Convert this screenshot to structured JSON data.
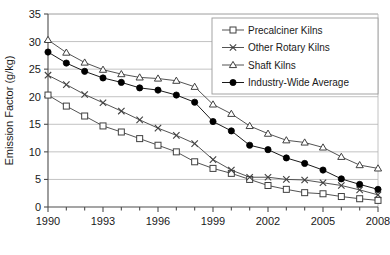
{
  "chart_data": {
    "type": "line",
    "title": "",
    "xlabel": "",
    "ylabel": "Emission Factor (g/kg)",
    "xlim": [
      1990,
      2008
    ],
    "ylim": [
      0,
      35
    ],
    "yticks": [
      0,
      5,
      10,
      15,
      20,
      25,
      30,
      35
    ],
    "ytick_labels": [
      "0",
      "5",
      "10",
      "15",
      "20",
      "25",
      "30",
      "35"
    ],
    "xticks": [
      1990,
      1993,
      1996,
      1999,
      2002,
      2005,
      2008
    ],
    "xtick_labels": [
      "1990",
      "1993",
      "1996",
      "1999",
      "2002",
      "2005",
      "2008"
    ],
    "x": [
      1990,
      1991,
      1992,
      1993,
      1994,
      1995,
      1996,
      1997,
      1998,
      1999,
      2000,
      2001,
      2002,
      2003,
      2004,
      2005,
      2006,
      2007,
      2008
    ],
    "grid": "horizontal",
    "legend_position": "top-right",
    "series": [
      {
        "name": "Precalciner Kilns",
        "marker": "open-square",
        "color": "#404040",
        "values": [
          20.3,
          18.3,
          16.5,
          14.7,
          13.6,
          12.4,
          11.2,
          10.0,
          8.2,
          7.0,
          6.1,
          5.0,
          3.9,
          3.2,
          2.6,
          2.4,
          1.9,
          1.5,
          1.2
        ]
      },
      {
        "name": "Other Rotary Kilns",
        "marker": "cross",
        "color": "#404040",
        "values": [
          23.9,
          22.2,
          20.4,
          18.9,
          17.4,
          15.8,
          14.3,
          13.0,
          11.5,
          8.6,
          6.7,
          5.4,
          5.4,
          5.0,
          4.9,
          4.4,
          3.9,
          3.1,
          2.2
        ]
      },
      {
        "name": "Shaft Kilns",
        "marker": "open-triangle",
        "color": "#404040",
        "values": [
          30.3,
          28.0,
          26.2,
          24.9,
          24.1,
          23.5,
          23.3,
          22.9,
          21.8,
          18.6,
          16.9,
          14.7,
          13.3,
          12.1,
          11.7,
          10.8,
          9.1,
          7.6,
          7.0
        ]
      },
      {
        "name": "Industry-Wide Average",
        "marker": "filled-circle",
        "color": "#000000",
        "values": [
          28.1,
          26.1,
          24.6,
          23.4,
          22.6,
          21.6,
          21.2,
          20.3,
          19.0,
          15.5,
          13.8,
          11.2,
          10.4,
          8.9,
          7.9,
          6.7,
          5.1,
          4.1,
          3.2
        ]
      }
    ]
  }
}
